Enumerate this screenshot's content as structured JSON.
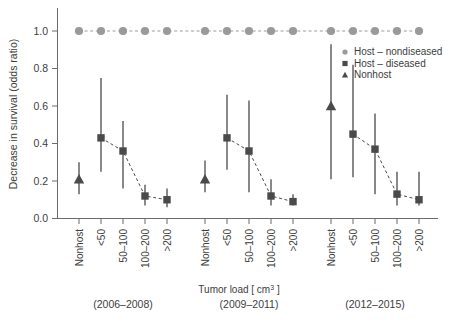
{
  "chart_data": {
    "type": "scatter",
    "title": "",
    "xlabel": "Tumor load [ cm³ ]",
    "ylabel": "Decrease in survival (odds ratio)",
    "ylim": [
      0.0,
      1.05
    ],
    "ytick_labels": [
      "0.0",
      "0.2",
      "0.4",
      "0.6",
      "0.8",
      "1.0"
    ],
    "ytick_values": [
      0.0,
      0.2,
      0.4,
      0.6,
      0.8,
      1.0
    ],
    "grid": false,
    "legend_position": "top-right",
    "categories": [
      "Nonhost",
      "<50",
      "50–100",
      "100–200",
      ">200"
    ],
    "groups": [
      {
        "label": "(2006–2008)",
        "points": [
          {
            "category": "Nonhost",
            "series": "Nonhost",
            "value": 0.21,
            "low": 0.13,
            "high": 0.3
          },
          {
            "category": "<50",
            "series": "Host – diseased",
            "value": 0.43,
            "low": 0.25,
            "high": 0.75
          },
          {
            "category": "50–100",
            "series": "Host – diseased",
            "value": 0.36,
            "low": 0.16,
            "high": 0.52
          },
          {
            "category": "100–200",
            "series": "Host – diseased",
            "value": 0.12,
            "low": 0.07,
            "high": 0.18
          },
          {
            "category": ">200",
            "series": "Host – diseased",
            "value": 0.1,
            "low": 0.06,
            "high": 0.16
          }
        ],
        "nondiseased": [
          {
            "category": "Nonhost",
            "value": 1.0
          },
          {
            "category": "<50",
            "value": 1.0
          },
          {
            "category": "50–100",
            "value": 1.0
          },
          {
            "category": "100–200",
            "value": 1.0
          },
          {
            "category": ">200",
            "value": 1.0
          }
        ]
      },
      {
        "label": "(2009–2011)",
        "points": [
          {
            "category": "Nonhost",
            "series": "Nonhost",
            "value": 0.21,
            "low": 0.14,
            "high": 0.31
          },
          {
            "category": "<50",
            "series": "Host – diseased",
            "value": 0.43,
            "low": 0.26,
            "high": 0.66
          },
          {
            "category": "50–100",
            "series": "Host – diseased",
            "value": 0.36,
            "low": 0.14,
            "high": 0.63
          },
          {
            "category": "100–200",
            "series": "Host – diseased",
            "value": 0.12,
            "low": 0.07,
            "high": 0.21
          },
          {
            "category": ">200",
            "series": "Host – diseased",
            "value": 0.09,
            "low": 0.07,
            "high": 0.13
          }
        ],
        "nondiseased": [
          {
            "category": "Nonhost",
            "value": 1.0
          },
          {
            "category": "<50",
            "value": 1.0
          },
          {
            "category": "50–100",
            "value": 1.0
          },
          {
            "category": "100–200",
            "value": 1.0
          },
          {
            "category": ">200",
            "value": 1.0
          }
        ]
      },
      {
        "label": "(2012–2015)",
        "points": [
          {
            "category": "Nonhost",
            "series": "Nonhost",
            "value": 0.6,
            "low": 0.21,
            "high": 0.93
          },
          {
            "category": "<50",
            "series": "Host – diseased",
            "value": 0.45,
            "low": 0.22,
            "high": 0.82
          },
          {
            "category": "50–100",
            "series": "Host – diseased",
            "value": 0.37,
            "low": 0.13,
            "high": 0.56
          },
          {
            "category": "100–200",
            "series": "Host – diseased",
            "value": 0.13,
            "low": 0.07,
            "high": 0.25
          },
          {
            "category": ">200",
            "series": "Host – diseased",
            "value": 0.1,
            "low": 0.07,
            "high": 0.25
          }
        ],
        "nondiseased": [
          {
            "category": "Nonhost",
            "value": 1.0
          },
          {
            "category": "<50",
            "value": 1.0
          },
          {
            "category": "50–100",
            "value": 1.0
          },
          {
            "category": "100–200",
            "value": 1.0
          },
          {
            "category": ">200",
            "value": 1.0
          }
        ]
      }
    ],
    "series": [
      {
        "name": "Host – nondiseased",
        "marker": "circle",
        "color": "#9a9a9a"
      },
      {
        "name": "Host – diseased",
        "marker": "square",
        "color": "#4a4a4a"
      },
      {
        "name": "Nonhost",
        "marker": "triangle",
        "color": "#4a4a4a"
      }
    ]
  },
  "legend": {
    "items": [
      {
        "label": "Host – nondiseased"
      },
      {
        "label": "Host – diseased"
      },
      {
        "label": "Nonhost"
      }
    ]
  },
  "colors": {
    "nondiseased": "#9a9a9a",
    "diseased": "#4a4a4a",
    "nonhost": "#4a4a4a",
    "axis": "#6b6b6b",
    "text": "#3d3d3d",
    "background": "#ffffff"
  }
}
